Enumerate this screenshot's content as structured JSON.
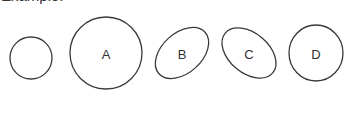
{
  "heading": {
    "text": "Example:"
  },
  "figure": {
    "stroke_color": "#3a3a3a",
    "shapes": [
      {
        "id": "reference",
        "type": "circle",
        "cx": 31,
        "cy": 58,
        "rx": 21,
        "ry": 21,
        "rotate": 0,
        "label": ""
      },
      {
        "id": "A",
        "type": "circle",
        "cx": 106,
        "cy": 53,
        "rx": 36,
        "ry": 36,
        "rotate": 0,
        "label": "A"
      },
      {
        "id": "B",
        "type": "ellipse",
        "cx": 182,
        "cy": 53,
        "rx": 31,
        "ry": 20,
        "rotate": -42,
        "label": "B"
      },
      {
        "id": "C",
        "type": "ellipse",
        "cx": 249,
        "cy": 53,
        "rx": 31,
        "ry": 20,
        "rotate": 40,
        "label": "C"
      },
      {
        "id": "D",
        "type": "circle",
        "cx": 316,
        "cy": 53,
        "rx": 27,
        "ry": 28,
        "rotate": 0,
        "label": "D"
      }
    ]
  }
}
